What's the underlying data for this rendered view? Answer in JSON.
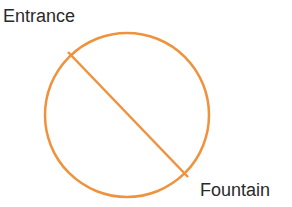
{
  "labels": {
    "entrance": "Entrance",
    "fountain": "Fountain"
  },
  "colors": {
    "stroke": "#f0923c",
    "text": "#2a2a2a"
  },
  "circle": {
    "cx": 127,
    "cy": 115,
    "r": 82
  },
  "chord": {
    "x1": 68,
    "y1": 52,
    "x2": 188,
    "y2": 177
  }
}
